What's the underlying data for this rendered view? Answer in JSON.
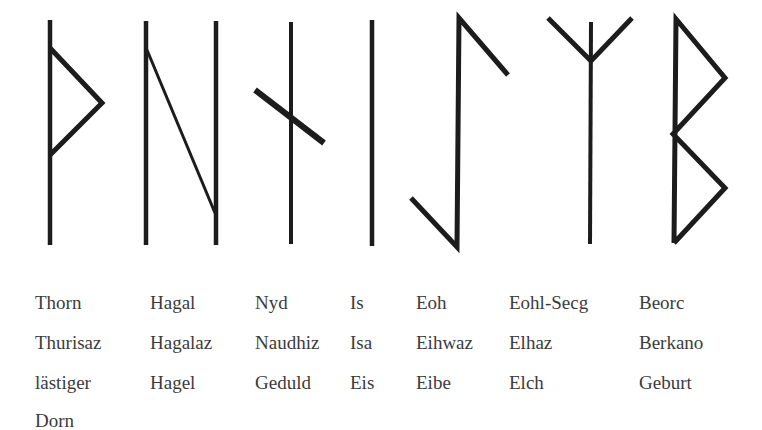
{
  "runes": [
    {
      "id": "thorn",
      "names": [
        "Thorn",
        "Thurisaz",
        "lästiger",
        "Dorn"
      ],
      "label_x": 35
    },
    {
      "id": "hagal",
      "names": [
        "Hagal",
        "Hagalaz",
        "Hagel"
      ],
      "label_x": 150
    },
    {
      "id": "nyd",
      "names": [
        "Nyd",
        "Naudhiz",
        "Geduld"
      ],
      "label_x": 255
    },
    {
      "id": "is",
      "names": [
        "Is",
        "Isa",
        "Eis"
      ],
      "label_x": 350
    },
    {
      "id": "eoh",
      "names": [
        "Eoh",
        "Eihwaz",
        "Eibe"
      ],
      "label_x": 416
    },
    {
      "id": "eohl-secg",
      "names": [
        "Eohl-Secg",
        "Elhaz",
        "Elch"
      ],
      "label_x": 509
    },
    {
      "id": "beorc",
      "names": [
        "Beorc",
        "Berkano",
        "Geburt"
      ],
      "label_x": 639
    }
  ],
  "colors": {
    "stroke": "#1c1c1c",
    "text": "#3b3b3b",
    "background": "#ffffff"
  }
}
